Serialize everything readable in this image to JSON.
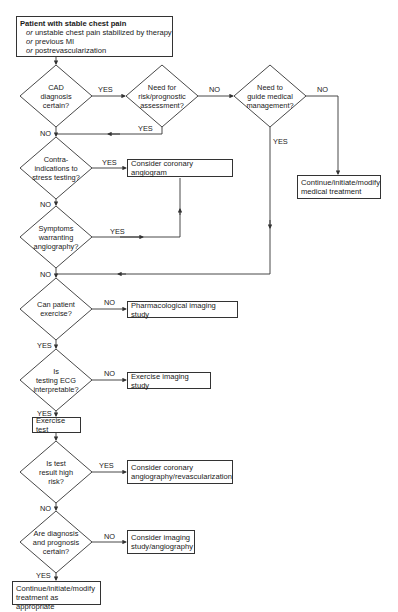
{
  "start": {
    "title": "Patient with stable chest pain",
    "lines": [
      {
        "prefix": "or",
        "text": " unstable chest pain stabilized by therapy"
      },
      {
        "prefix": "or",
        "text": " previous MI"
      },
      {
        "prefix": "or",
        "text": " postrevascularization"
      }
    ]
  },
  "decisions": {
    "cad": {
      "lines": [
        "CAD",
        "diagnosis",
        "certain?"
      ]
    },
    "risk": {
      "lines": [
        "Need for",
        "risk/prognostic",
        "assessment?"
      ]
    },
    "guide": {
      "lines": [
        "Need to",
        "guide medical",
        "management?"
      ]
    },
    "contra": {
      "lines": [
        "Contra-",
        "indications to",
        "stress testing?"
      ]
    },
    "symptoms": {
      "lines": [
        "Symptoms",
        "warranting",
        "angiography?"
      ]
    },
    "exercise": {
      "lines": [
        "Can patient",
        "exercise?"
      ]
    },
    "ecg": {
      "lines": [
        "Is",
        "testing ECG",
        "interpretable?"
      ]
    },
    "highrisk": {
      "lines": [
        "Is test",
        "result high",
        "risk?"
      ]
    },
    "certain": {
      "lines": [
        "Are diagnosis",
        "and prognosis",
        "certain?"
      ]
    }
  },
  "actions": {
    "medical_treatment": {
      "lines": [
        "Continue/initiate/modify",
        "medical treatment"
      ]
    },
    "coronary_angiogram": {
      "lines": [
        "Consider coronary angiogram"
      ]
    },
    "pharm_imaging": {
      "lines": [
        "Pharmacological imaging study"
      ]
    },
    "exercise_imaging": {
      "lines": [
        "Exercise imaging study"
      ]
    },
    "exercise_test": {
      "lines": [
        "Exercise test"
      ]
    },
    "angio_revasc": {
      "lines": [
        "Consider coronary",
        "angiography/revascularization"
      ]
    },
    "imaging_angio": {
      "lines": [
        "Consider imaging",
        "study/angiography"
      ]
    },
    "treatment_appropriate": {
      "lines": [
        "Continue/initiate/modify",
        "treatment as appropriate"
      ]
    }
  },
  "edge_labels": {
    "cad_yes": "YES",
    "cad_no": "NO",
    "risk_no": "NO",
    "risk_yes": "YES",
    "guide_no": "NO",
    "guide_yes": "YES",
    "contra_yes": "YES",
    "contra_no": "NO",
    "symptoms_yes": "YES",
    "symptoms_no": "NO",
    "exercise_no": "NO",
    "exercise_yes": "YES",
    "ecg_no": "NO",
    "ecg_yes": "YES",
    "highrisk_yes": "YES",
    "highrisk_no": "NO",
    "certain_no": "NO",
    "certain_yes": "YES"
  },
  "colors": {
    "line": "#333333",
    "text": "#1a1a1a",
    "background": "#ffffff"
  }
}
